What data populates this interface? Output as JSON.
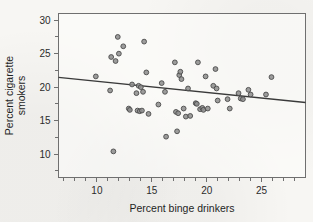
{
  "chart_data": {
    "type": "scatter",
    "title": "",
    "xlabel": "Percent binge drinkers",
    "ylabel_line1": "Percent cigarette",
    "ylabel_line2": "smokers",
    "xlim": [
      6.5,
      29.0
    ],
    "ylim": [
      6.5,
      31.0
    ],
    "xticks": [
      10,
      15,
      20,
      25
    ],
    "xticks_minor": [
      7,
      8,
      9,
      11,
      12,
      13,
      14,
      16,
      17,
      18,
      19,
      21,
      22,
      23,
      24,
      26,
      27,
      28
    ],
    "yticks": [
      10,
      15,
      20,
      25,
      30
    ],
    "grid": false,
    "legend": false,
    "marker": {
      "shape": "circle",
      "fill": "#8e8e8e",
      "edge": "#4a4a4a",
      "radius": 2.4
    },
    "trendline": {
      "label": "least-squares regression line",
      "color": "#3a3a3a",
      "x_start": 6.5,
      "y_start": 21.45,
      "x_end": 29.0,
      "y_end": 17.7,
      "slope": -0.1667,
      "intercept": 22.53
    },
    "points": [
      {
        "x": 9.9,
        "y": 21.6
      },
      {
        "x": 11.2,
        "y": 19.5
      },
      {
        "x": 11.3,
        "y": 24.5
      },
      {
        "x": 11.5,
        "y": 10.4
      },
      {
        "x": 11.7,
        "y": 23.9
      },
      {
        "x": 11.9,
        "y": 27.5
      },
      {
        "x": 12.0,
        "y": 25.0
      },
      {
        "x": 12.4,
        "y": 26.1
      },
      {
        "x": 12.9,
        "y": 16.8
      },
      {
        "x": 13.0,
        "y": 16.6
      },
      {
        "x": 13.2,
        "y": 20.4
      },
      {
        "x": 13.6,
        "y": 19.1
      },
      {
        "x": 13.7,
        "y": 16.5
      },
      {
        "x": 13.8,
        "y": 20.2
      },
      {
        "x": 13.9,
        "y": 16.4
      },
      {
        "x": 14.0,
        "y": 20.0
      },
      {
        "x": 14.1,
        "y": 16.5
      },
      {
        "x": 14.2,
        "y": 19.3
      },
      {
        "x": 14.3,
        "y": 26.8
      },
      {
        "x": 14.5,
        "y": 22.2
      },
      {
        "x": 14.7,
        "y": 16.0
      },
      {
        "x": 15.6,
        "y": 17.4
      },
      {
        "x": 15.9,
        "y": 20.6
      },
      {
        "x": 16.2,
        "y": 19.3
      },
      {
        "x": 16.3,
        "y": 12.6
      },
      {
        "x": 17.1,
        "y": 23.7
      },
      {
        "x": 17.2,
        "y": 16.3
      },
      {
        "x": 17.3,
        "y": 13.4
      },
      {
        "x": 17.4,
        "y": 16.1
      },
      {
        "x": 17.5,
        "y": 21.8
      },
      {
        "x": 17.6,
        "y": 22.3
      },
      {
        "x": 17.7,
        "y": 21.2
      },
      {
        "x": 17.9,
        "y": 16.8
      },
      {
        "x": 18.1,
        "y": 15.6
      },
      {
        "x": 18.3,
        "y": 19.8
      },
      {
        "x": 18.5,
        "y": 15.7
      },
      {
        "x": 19.0,
        "y": 17.6
      },
      {
        "x": 19.1,
        "y": 17.5
      },
      {
        "x": 19.2,
        "y": 23.7
      },
      {
        "x": 19.4,
        "y": 16.7
      },
      {
        "x": 19.6,
        "y": 16.9
      },
      {
        "x": 19.7,
        "y": 16.6
      },
      {
        "x": 19.9,
        "y": 21.6
      },
      {
        "x": 20.1,
        "y": 16.8
      },
      {
        "x": 20.6,
        "y": 20.2
      },
      {
        "x": 20.8,
        "y": 22.7
      },
      {
        "x": 20.9,
        "y": 19.8
      },
      {
        "x": 21.0,
        "y": 18.0
      },
      {
        "x": 21.9,
        "y": 18.2
      },
      {
        "x": 22.1,
        "y": 16.8
      },
      {
        "x": 22.9,
        "y": 19.1
      },
      {
        "x": 23.1,
        "y": 18.3
      },
      {
        "x": 23.3,
        "y": 18.2
      },
      {
        "x": 23.8,
        "y": 19.6
      },
      {
        "x": 24.0,
        "y": 18.9
      },
      {
        "x": 25.4,
        "y": 18.9
      },
      {
        "x": 25.9,
        "y": 21.5
      }
    ]
  }
}
